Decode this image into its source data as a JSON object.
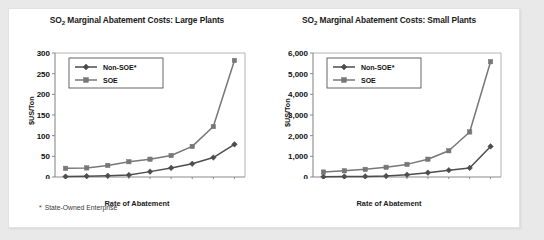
{
  "figure": {
    "footnote_marker": "*",
    "footnote_text": "State-Owned Enterprise",
    "panel_background": "#ffffff",
    "page_background": "#e9e9e9",
    "series_colors": {
      "non_soe": "#4d4d4d",
      "soe": "#777777"
    }
  },
  "chart_data": [
    {
      "id": "large-plants",
      "type": "line",
      "title_prefix": "SO",
      "title_sub": "2",
      "title_suffix": " Marginal Abatement Costs: Large Plants",
      "title": "SO2 Marginal Abatement Costs: Large Plants",
      "xlabel": "Rate of Abatement",
      "ylabel": "$US/Ton",
      "x": [
        0.1,
        0.2,
        0.3,
        0.4,
        0.5,
        0.6,
        0.7,
        0.8,
        0.9
      ],
      "xticklabels": [
        "0.1",
        "0.2",
        "0.3",
        "0.4",
        "0.5",
        "0.6",
        "0.7",
        "0.8",
        "0.9"
      ],
      "yticks": [
        0,
        50,
        100,
        150,
        200,
        250,
        300
      ],
      "yticklabels": [
        "0",
        "50",
        "100",
        "150",
        "200",
        "250",
        "300"
      ],
      "ylim": [
        0,
        300
      ],
      "xlim": [
        0.05,
        0.95
      ],
      "grid": false,
      "legend_position": "upper-left-inside",
      "series": [
        {
          "name": "Non-SOE*",
          "marker": "diamond",
          "color": "#4d4d4d",
          "values": [
            1,
            2,
            3,
            5,
            13,
            22,
            32,
            47,
            79
          ]
        },
        {
          "name": "SOE",
          "marker": "square",
          "color": "#777777",
          "values": [
            21,
            22,
            28,
            37,
            43,
            52,
            74,
            122,
            282
          ]
        }
      ]
    },
    {
      "id": "small-plants",
      "type": "line",
      "title_prefix": "SO",
      "title_sub": "2",
      "title_suffix": " Marginal Abatement Costs: Small Plants",
      "title": "SO2 Marginal Abatement Costs: Small Plants",
      "xlabel": "Rate of Abatement",
      "ylabel": "$US/Ton",
      "x": [
        0.1,
        0.2,
        0.3,
        0.4,
        0.5,
        0.6,
        0.7,
        0.8,
        0.9
      ],
      "xticklabels": [
        "0.1",
        "0.2",
        "0.3",
        "0.4",
        "0.5",
        "0.6",
        "0.7",
        "0.8",
        "0.9"
      ],
      "yticks": [
        0,
        1000,
        2000,
        3000,
        4000,
        5000,
        6000
      ],
      "yticklabels": [
        "0",
        "1,000",
        "2,000",
        "3,000",
        "4,000",
        "5,000",
        "6,000"
      ],
      "ylim": [
        0,
        6000
      ],
      "xlim": [
        0.05,
        0.95
      ],
      "grid": false,
      "legend_position": "upper-left-inside",
      "series": [
        {
          "name": "Non-SOE*",
          "marker": "diamond",
          "color": "#4d4d4d",
          "values": [
            10,
            20,
            30,
            50,
            110,
            210,
            330,
            440,
            1480
          ]
        },
        {
          "name": "SOE",
          "marker": "square",
          "color": "#777777",
          "values": [
            240,
            300,
            370,
            470,
            610,
            860,
            1270,
            2180,
            5580
          ]
        }
      ]
    }
  ]
}
